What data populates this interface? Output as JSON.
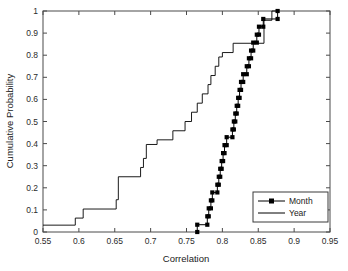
{
  "chart_data": {
    "type": "line",
    "title": "",
    "xlabel": "Correlation",
    "ylabel": "Cumulative Probability",
    "xlim": [
      0.55,
      0.95
    ],
    "ylim": [
      0,
      1
    ],
    "xticks": [
      0.55,
      0.6,
      0.65,
      0.7,
      0.75,
      0.8,
      0.85,
      0.9,
      0.95
    ],
    "xtick_labels": [
      "0.55",
      "0.6",
      "0.65",
      "0.7",
      "0.75",
      "0.8",
      "0.85",
      "0.9",
      "0.95"
    ],
    "yticks": [
      0,
      0.1,
      0.2,
      0.3,
      0.4,
      0.5,
      0.6,
      0.7,
      0.8,
      0.9,
      1
    ],
    "ytick_labels": [
      "0",
      "0.1",
      "0.2",
      "0.3",
      "0.4",
      "0.5",
      "0.6",
      "0.7",
      "0.8",
      "0.9",
      "1"
    ],
    "grid": false,
    "step_style": "post",
    "legend_position": "lower right",
    "series": [
      {
        "name": "Month",
        "marker": "square",
        "has_markers": true,
        "color": "#000000",
        "points": [
          [
            0.765,
            0.0
          ],
          [
            0.765,
            0.033
          ],
          [
            0.779,
            0.033
          ],
          [
            0.779,
            0.071
          ],
          [
            0.781,
            0.071
          ],
          [
            0.781,
            0.107
          ],
          [
            0.784,
            0.107
          ],
          [
            0.784,
            0.143
          ],
          [
            0.786,
            0.143
          ],
          [
            0.786,
            0.179
          ],
          [
            0.793,
            0.179
          ],
          [
            0.793,
            0.214
          ],
          [
            0.795,
            0.214
          ],
          [
            0.795,
            0.25
          ],
          [
            0.797,
            0.25
          ],
          [
            0.797,
            0.286
          ],
          [
            0.799,
            0.286
          ],
          [
            0.799,
            0.321
          ],
          [
            0.801,
            0.321
          ],
          [
            0.801,
            0.357
          ],
          [
            0.803,
            0.357
          ],
          [
            0.803,
            0.393
          ],
          [
            0.806,
            0.393
          ],
          [
            0.806,
            0.429
          ],
          [
            0.814,
            0.429
          ],
          [
            0.814,
            0.464
          ],
          [
            0.816,
            0.464
          ],
          [
            0.816,
            0.5
          ],
          [
            0.818,
            0.5
          ],
          [
            0.818,
            0.536
          ],
          [
            0.82,
            0.536
          ],
          [
            0.82,
            0.571
          ],
          [
            0.822,
            0.571
          ],
          [
            0.822,
            0.607
          ],
          [
            0.824,
            0.607
          ],
          [
            0.824,
            0.643
          ],
          [
            0.826,
            0.643
          ],
          [
            0.826,
            0.679
          ],
          [
            0.829,
            0.679
          ],
          [
            0.829,
            0.714
          ],
          [
            0.834,
            0.714
          ],
          [
            0.834,
            0.75
          ],
          [
            0.837,
            0.75
          ],
          [
            0.837,
            0.786
          ],
          [
            0.84,
            0.786
          ],
          [
            0.84,
            0.821
          ],
          [
            0.843,
            0.821
          ],
          [
            0.843,
            0.857
          ],
          [
            0.848,
            0.857
          ],
          [
            0.848,
            0.893
          ],
          [
            0.851,
            0.893
          ],
          [
            0.851,
            0.929
          ],
          [
            0.857,
            0.929
          ],
          [
            0.857,
            0.964
          ],
          [
            0.877,
            0.964
          ],
          [
            0.877,
            1.0
          ]
        ]
      },
      {
        "name": "Year",
        "marker": "none",
        "has_markers": false,
        "color": "#000000",
        "points": [
          [
            0.55,
            0.031
          ],
          [
            0.595,
            0.031
          ],
          [
            0.595,
            0.063
          ],
          [
            0.606,
            0.063
          ],
          [
            0.606,
            0.104
          ],
          [
            0.652,
            0.104
          ],
          [
            0.652,
            0.146
          ],
          [
            0.655,
            0.146
          ],
          [
            0.655,
            0.25
          ],
          [
            0.686,
            0.25
          ],
          [
            0.686,
            0.292
          ],
          [
            0.69,
            0.292
          ],
          [
            0.69,
            0.333
          ],
          [
            0.694,
            0.333
          ],
          [
            0.694,
            0.396
          ],
          [
            0.709,
            0.396
          ],
          [
            0.709,
            0.417
          ],
          [
            0.731,
            0.417
          ],
          [
            0.731,
            0.458
          ],
          [
            0.748,
            0.458
          ],
          [
            0.748,
            0.5
          ],
          [
            0.757,
            0.5
          ],
          [
            0.757,
            0.542
          ],
          [
            0.765,
            0.542
          ],
          [
            0.765,
            0.583
          ],
          [
            0.772,
            0.583
          ],
          [
            0.772,
            0.625
          ],
          [
            0.78,
            0.625
          ],
          [
            0.78,
            0.667
          ],
          [
            0.784,
            0.667
          ],
          [
            0.784,
            0.708
          ],
          [
            0.79,
            0.708
          ],
          [
            0.79,
            0.75
          ],
          [
            0.795,
            0.75
          ],
          [
            0.795,
            0.792
          ],
          [
            0.8,
            0.792
          ],
          [
            0.8,
            0.812
          ],
          [
            0.815,
            0.812
          ],
          [
            0.815,
            0.854
          ],
          [
            0.858,
            0.854
          ],
          [
            0.858,
            0.958
          ],
          [
            0.869,
            0.958
          ],
          [
            0.869,
            1.0
          ],
          [
            0.877,
            1.0
          ]
        ]
      }
    ]
  },
  "legend": {
    "entries": [
      {
        "label": "Month"
      },
      {
        "label": "Year"
      }
    ]
  }
}
